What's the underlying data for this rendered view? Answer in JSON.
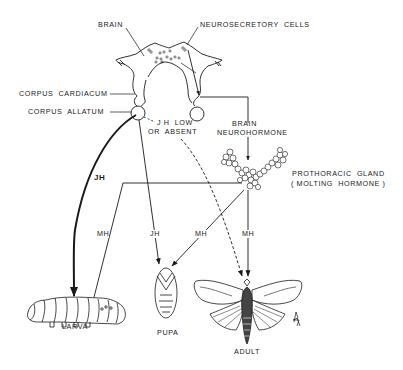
{
  "labels": {
    "brain": "BRAIN",
    "neurosecretory_cells": "NEUROSECRETORY  CELLS",
    "corpus_cardiacum": "CORPUS  CARDIACUM",
    "corpus_allatum": "CORPUS  ALLATUM",
    "jh_low_line1": "J H  LOW",
    "jh_low_line2": "OR  ABSENT",
    "brain_neurohormone_line1": "BRAIN",
    "brain_neurohormone_line2": "NEUROHORMONE",
    "prothoracic_gland_line1": "PROTHORACIC  GLAND",
    "prothoracic_gland_line2": "( MOLTING  HORMONE )",
    "jh_main": "JH",
    "mh_larva": "MH",
    "jh_pupa": "JH",
    "mh_pupa": "MH",
    "mh_adult": "MH"
  },
  "stages": {
    "larva": "LARVA",
    "pupa": "PUPA",
    "adult": "ADULT"
  },
  "colors": {
    "ink": "#1a1a1a",
    "background": "#ffffff"
  }
}
